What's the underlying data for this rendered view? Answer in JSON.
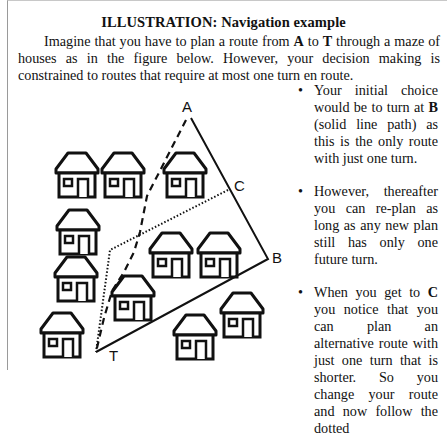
{
  "document": {
    "title": "ILLUSTRATION: Navigation example",
    "intro": {
      "part1": "Imagine that you have to plan a route from ",
      "start": "A",
      "part2": " to ",
      "target": "T",
      "part3": " through a maze of houses as in the figure below. However, your decision making is constrained to routes that require at most one turn en route."
    },
    "bullets": [
      {
        "marker": "•",
        "pre": "Your initial choice would be to turn at ",
        "bold": "B",
        "post": " (solid line path) as this is the only route with just one turn."
      },
      {
        "marker": "•",
        "pre": "However, thereafter you can re-plan as long as any new plan still has only one future turn.",
        "bold": "",
        "post": ""
      },
      {
        "marker": "•",
        "pre": "When you get to ",
        "bold": "C",
        "post": " you notice that you can plan an alternative route with just one turn that is shorter. So you change your route and now follow the dotted"
      }
    ]
  },
  "figure": {
    "labels": {
      "a": "A",
      "b": "B",
      "c": "C",
      "t": "T"
    },
    "paths": {
      "solid": "initial route A-B-T",
      "dashed": "direct path A-T",
      "dotted": "re-planned route C-T"
    },
    "house_count": 11,
    "line_color": "#111111"
  }
}
